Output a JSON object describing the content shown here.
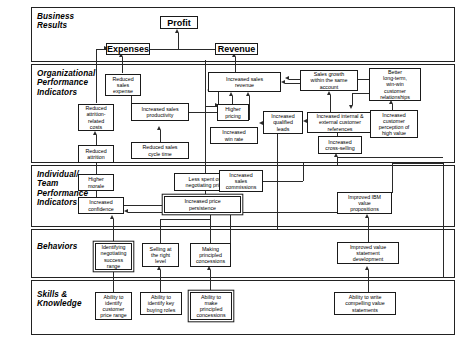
{
  "diagram": {
    "bands": [
      {
        "id": "business-results",
        "label": "Business\nResults"
      },
      {
        "id": "organizational-performance-indicators",
        "label": "Organizational\nPerformance\nIndicators"
      },
      {
        "id": "individual-team-performance-indicators",
        "label": "Individual/\nTeam\nPerformance\nIndicators"
      },
      {
        "id": "behaviors",
        "label": "Behaviors"
      },
      {
        "id": "skills-knowledge",
        "label": "Skills &\nKnowledge"
      }
    ],
    "nodes": {
      "profit": "Profit",
      "expenses": "Expenses",
      "revenue": "Revenue",
      "reduced_sales_expense": "Reduced\nsales\nexpense",
      "reduced_attrition_costs": "Reduced\nattrition-\nrelated\ncosts",
      "reduced_attrition": "Reduced\nattrition",
      "increased_sales_productivity": "Increased sales\nproductivity",
      "reduced_sales_cycle_time": "Reduced sales\ncycle time",
      "increased_sales_revenue": "Increased sales\nrevenue",
      "higher_pricing": "Higher\npricing",
      "increased_win_rate": "Increased\nwin rate",
      "increased_qualified_leads": "Increased\nqualified\nleads",
      "sales_growth_same_account": "Sales growth\nwithin the same\naccount",
      "increased_customer_references": "Increased internal &\nexternal customer\nreferences",
      "increased_cross_selling": "Increased\ncross-selling",
      "better_relationships": "Better\nlong-term,\nwin-win\ncustomer\nrelationships",
      "increased_customer_perception": "Increased\ncustomer\nperception of\nhigh value",
      "higher_morale": "Higher\nmorale",
      "increased_confidence": "Increased\nconfidence",
      "less_spent_negotiating": "Less spent on\nnegotiating price",
      "increased_price_persistence": "Increased price\npersistence",
      "increased_sales_commissions": "Increased\nsales\ncommissions",
      "improved_ibm_value_propositions": "Improved IBM\nvalue\npropositions",
      "identifying_negotiating_range": "Identifying\nnegotiating\nsuccess\nrange",
      "selling_right_level": "Selling at\nthe right\nlevel",
      "making_principled_concessions": "Making\nprincipled\nconcessions",
      "improved_value_statement_development": "Improved value\nstatement\ndevelopment",
      "ability_customer_price_range": "Ability to\nidentify\ncustomer\nprice range",
      "ability_key_buying_roles": "Ability to\nidentify  key\nbuying roles",
      "ability_principled_concessions": "Ability to\nmake\nprincipled\nconcessions",
      "ability_write_value_statements": "Ability to write\ncompelling value\nstatements"
    },
    "colors": {
      "line": "#2a2a2a",
      "box_border": "#1a1a1a",
      "background": "#ffffff"
    }
  }
}
